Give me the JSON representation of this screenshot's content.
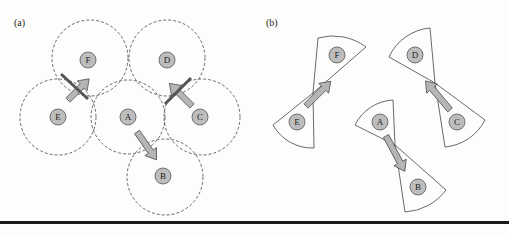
{
  "panel_a": {
    "label": "(a)",
    "nodes": [
      {
        "id": "F",
        "x": 88,
        "y": 60
      },
      {
        "id": "D",
        "x": 167,
        "y": 60
      },
      {
        "id": "E",
        "x": 58,
        "y": 117
      },
      {
        "id": "A",
        "x": 128,
        "y": 117
      },
      {
        "id": "C",
        "x": 200,
        "y": 117
      },
      {
        "id": "B",
        "x": 163,
        "y": 176
      }
    ],
    "arrows": [
      {
        "from": "E",
        "to": "F",
        "blocked": true
      },
      {
        "from": "C",
        "to": "D",
        "blocked": true
      },
      {
        "from": "A",
        "to": "B",
        "blocked": false
      }
    ]
  },
  "panel_b": {
    "label": "(b)",
    "nodes": [
      {
        "id": "F",
        "x": 337,
        "y": 55
      },
      {
        "id": "D",
        "x": 415,
        "y": 55
      },
      {
        "id": "E",
        "x": 297,
        "y": 122
      },
      {
        "id": "A",
        "x": 380,
        "y": 122
      },
      {
        "id": "C",
        "x": 457,
        "y": 122
      },
      {
        "id": "B",
        "x": 418,
        "y": 187
      }
    ],
    "arrows": [
      {
        "from": "E",
        "to": "F"
      },
      {
        "from": "C",
        "to": "D"
      },
      {
        "from": "A",
        "to": "B"
      }
    ]
  },
  "colors": {
    "node_fill": "#bdbdbd",
    "arrow_fill": "#b5b5b5",
    "stroke": "#444444",
    "block_bar": "#555555"
  }
}
